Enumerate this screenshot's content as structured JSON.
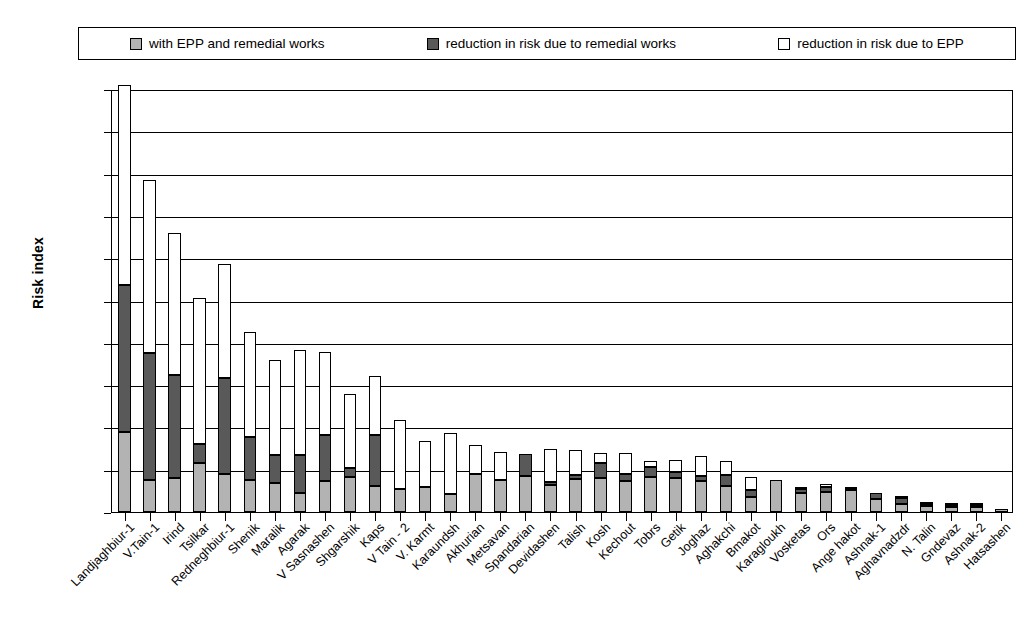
{
  "legend": {
    "items": [
      {
        "label": "with EPP and remedial works",
        "swatch": "light-gray-square-icon",
        "color": "#b3b3b3"
      },
      {
        "label": "reduction in risk due to remedial works",
        "swatch": "dark-gray-square-icon",
        "color": "#595959"
      },
      {
        "label": "reduction in risk due to EPP",
        "swatch": "white-square-icon",
        "color": "#ffffff"
      }
    ]
  },
  "chart_data": {
    "type": "bar",
    "stacked": true,
    "title": "",
    "xlabel": "",
    "ylabel": "Risk index",
    "ylim": [
      0,
      20000
    ],
    "ytick_step": 2000,
    "yticks": [
      "0",
      "2000",
      "4000",
      "6000",
      "8000",
      "10000",
      "12000",
      "14000",
      "16000",
      "18000",
      "20000"
    ],
    "grid": "horizontal",
    "legend_position": "top",
    "categories": [
      "Landjaghbiur-1",
      "V.Tain-1",
      "Irind",
      "Tsilkar",
      "Redneghbiur-1",
      "Shenik",
      "Maralik",
      "Agarak",
      "V Sasnashen",
      "Shgarshik",
      "Kaps",
      "V Tain - 2",
      "V. Karmt",
      "Karaundsh",
      "Akhurian",
      "Metsavan",
      "Spandarian",
      "Devidashen",
      "Talish",
      "Kosh",
      "Kechout",
      "Tobrs",
      "Getik",
      "Joghaz",
      "Aghakchi",
      "Bmakot",
      "Karagloukh",
      "Vosketas",
      "Ors",
      "Ange hakot",
      "Ashnak-1",
      "Aghavnadzdr",
      "N. Talin",
      "Gndevaz",
      "Ashnak-2",
      "Hatsashen"
    ],
    "series": [
      {
        "name": "with EPP and remedial works",
        "color": "#b3b3b3",
        "values": [
          3800,
          1500,
          1600,
          2300,
          1800,
          1500,
          1350,
          900,
          1450,
          1650,
          1250,
          1100,
          1200,
          850,
          1800,
          1500,
          1700,
          1300,
          1550,
          1600,
          1450,
          1650,
          1600,
          1450,
          1250,
          700,
          1500,
          900,
          950,
          1050,
          600,
          400,
          280,
          250,
          230,
          120
        ]
      },
      {
        "name": "reduction in risk due to remedial works",
        "color": "#595959",
        "values": [
          6950,
          6000,
          4900,
          900,
          4550,
          2050,
          1350,
          1800,
          2200,
          450,
          2400,
          0,
          0,
          0,
          0,
          0,
          1050,
          100,
          200,
          700,
          350,
          500,
          300,
          250,
          500,
          350,
          0,
          200,
          230,
          50,
          300,
          250,
          120,
          80,
          100,
          0
        ]
      },
      {
        "name": "reduction in risk due to EPP",
        "color": "#ffffff",
        "values": [
          9450,
          8200,
          6700,
          6900,
          5400,
          4950,
          4500,
          4950,
          3900,
          3500,
          2800,
          3250,
          2150,
          2900,
          1350,
          1350,
          0,
          1600,
          1200,
          500,
          1000,
          250,
          550,
          950,
          650,
          600,
          0,
          100,
          150,
          100,
          0,
          100,
          50,
          50,
          50,
          0
        ]
      }
    ]
  }
}
